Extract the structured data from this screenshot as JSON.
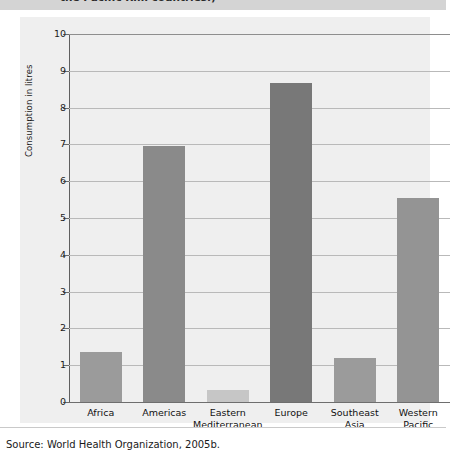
{
  "caption": {
    "clipped_line": "the Pacific Rim countries.)"
  },
  "source": {
    "text": "Source: World Health Organization, 2005b."
  },
  "chart_data": {
    "type": "bar",
    "title": "",
    "xlabel": "",
    "ylabel": "Consumption in litres",
    "categories": [
      "Africa",
      "Americas",
      "Eastern Mediterranean",
      "Europe",
      "Southeast Asia",
      "Western Pacific"
    ],
    "category_lines": [
      [
        "Africa"
      ],
      [
        "Americas"
      ],
      [
        "Eastern",
        "Mediterranean"
      ],
      [
        "Europe"
      ],
      [
        "Southeast",
        "Asia"
      ],
      [
        "Western",
        "Pacific"
      ]
    ],
    "values": [
      1.37,
      6.95,
      0.32,
      8.67,
      1.2,
      5.55
    ],
    "bar_colors": [
      "#9b9b9b",
      "#8a8a8a",
      "#c6c6c6",
      "#787878",
      "#9b9b9b",
      "#949494"
    ],
    "ylim": [
      0,
      10
    ],
    "ytick_labels": [
      "10",
      "9",
      "8",
      "7",
      "6",
      "5",
      "4",
      "3",
      "2",
      "1",
      "0"
    ],
    "ytick_values": [
      10,
      9,
      8,
      7,
      6,
      5,
      4,
      3,
      2,
      1,
      0
    ],
    "grid": true,
    "legend": null,
    "plot_background": "#efefef"
  }
}
